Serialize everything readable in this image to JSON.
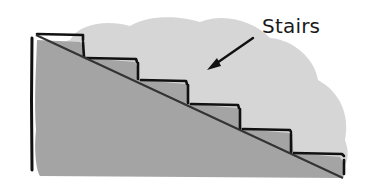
{
  "diagram": {
    "type": "illustration",
    "label": "Stairs",
    "colors": {
      "background": "#ffffff",
      "cloud_fill": "#d6d6d6",
      "triangle_fill": "#a4a4a4",
      "lines": "#111111",
      "diagonal": "#333333"
    },
    "steps": [
      {
        "index": 1
      },
      {
        "index": 2
      },
      {
        "index": 3
      },
      {
        "index": 4
      },
      {
        "index": 5
      },
      {
        "index": 6
      }
    ]
  }
}
